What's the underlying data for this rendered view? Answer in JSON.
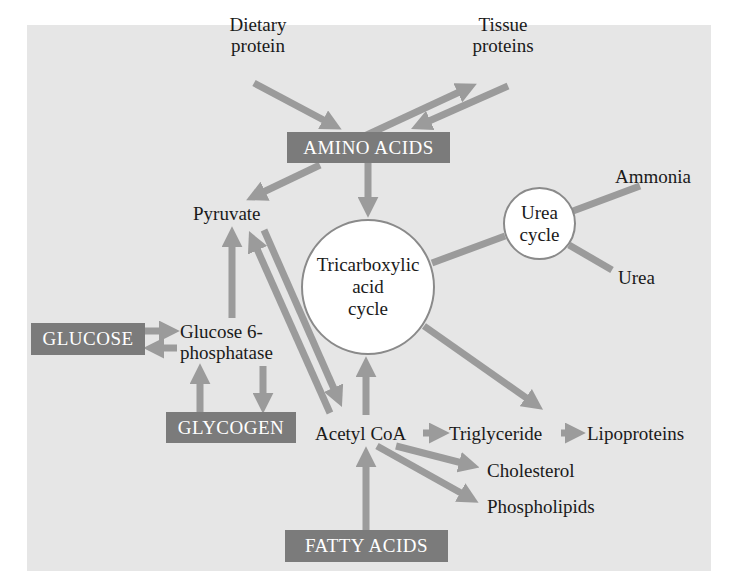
{
  "colors": {
    "background": "#ffffff",
    "panel": "#e6e6e6",
    "arrow": "#9b9b9b",
    "box_fill": "#7b7b7b",
    "box_text": "#ffffff",
    "circle_fill": "#ffffff",
    "circle_border": "#8a8a8a",
    "text": "#1a1a1a"
  },
  "nodes": {
    "dietary_protein": {
      "line1": "Dietary",
      "line2": "protein"
    },
    "tissue_proteins": {
      "line1": "Tissue",
      "line2": "proteins"
    },
    "amino_acids": "AMINO ACIDS",
    "pyruvate": "Pyruvate",
    "tca_cycle": {
      "line1": "Tricarboxylic",
      "line2": "acid",
      "line3": "cycle"
    },
    "urea_cycle": {
      "line1": "Urea",
      "line2": "cycle"
    },
    "ammonia": "Ammonia",
    "urea": "Urea",
    "glucose": "GLUCOSE",
    "glucose_6_phosphatase": {
      "line1": "Glucose 6-",
      "line2": "phosphatase"
    },
    "glycogen": "GLYCOGEN",
    "acetyl_coa": "Acetyl CoA",
    "triglyceride": "Triglyceride",
    "lipoproteins": "Lipoproteins",
    "cholesterol": "Cholesterol",
    "phospholipids": "Phospholipids",
    "fatty_acids": "FATTY ACIDS"
  },
  "edges": [
    {
      "from": "Dietary protein",
      "to": "AMINO ACIDS"
    },
    {
      "from": "AMINO ACIDS",
      "to": "Tissue proteins"
    },
    {
      "from": "Tissue proteins",
      "to": "AMINO ACIDS"
    },
    {
      "from": "AMINO ACIDS",
      "to": "Pyruvate"
    },
    {
      "from": "AMINO ACIDS",
      "to": "Tricarboxylic acid cycle"
    },
    {
      "from": "Tricarboxylic acid cycle",
      "to": "Urea cycle",
      "arrow": false
    },
    {
      "from": "Urea cycle",
      "to": "Ammonia",
      "arrow": false
    },
    {
      "from": "Urea cycle",
      "to": "Urea",
      "arrow": false
    },
    {
      "from": "Glucose 6-phosphatase",
      "to": "Pyruvate"
    },
    {
      "from": "GLUCOSE",
      "to": "Glucose 6-phosphatase"
    },
    {
      "from": "Glucose 6-phosphatase",
      "to": "GLUCOSE"
    },
    {
      "from": "GLYCOGEN",
      "to": "Glucose 6-phosphatase"
    },
    {
      "from": "Glucose 6-phosphatase",
      "to": "GLYCOGEN"
    },
    {
      "from": "Acetyl CoA",
      "to": "Pyruvate"
    },
    {
      "from": "Pyruvate",
      "to": "Acetyl CoA"
    },
    {
      "from": "Acetyl CoA",
      "to": "Tricarboxylic acid cycle"
    },
    {
      "from": "Tricarboxylic acid cycle",
      "to": "Triglyceride"
    },
    {
      "from": "Acetyl CoA",
      "to": "Triglyceride"
    },
    {
      "from": "Triglyceride",
      "to": "Lipoproteins"
    },
    {
      "from": "Acetyl CoA",
      "to": "Cholesterol"
    },
    {
      "from": "Acetyl CoA",
      "to": "Phospholipids"
    },
    {
      "from": "FATTY ACIDS",
      "to": "Acetyl CoA"
    }
  ]
}
